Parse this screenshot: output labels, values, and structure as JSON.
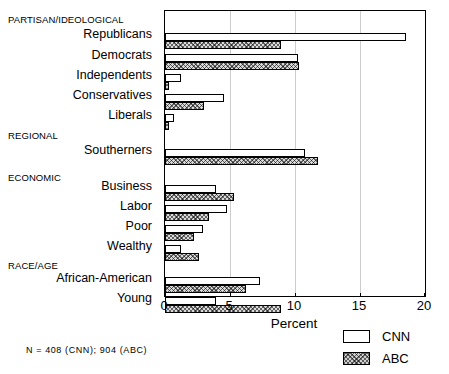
{
  "chart_data": {
    "type": "bar",
    "orientation": "horizontal",
    "title": "",
    "xlabel": "Percent",
    "ylabel": "",
    "xlim": [
      0,
      20
    ],
    "xticks": [
      0,
      5,
      10,
      15,
      20
    ],
    "xticklabels": [
      "0",
      "5",
      "10",
      "15",
      "20"
    ],
    "grid": true,
    "grid_axis": "x",
    "legend_position": "bottom-right",
    "legend": [
      "CNN",
      "ABC"
    ],
    "series": [
      {
        "name": "CNN",
        "style": "open",
        "values": [
          18.5,
          10.2,
          1.2,
          4.5,
          0.7,
          10.8,
          3.9,
          4.8,
          2.9,
          1.2,
          7.3,
          3.9
        ]
      },
      {
        "name": "ABC",
        "style": "hatched",
        "values": [
          8.9,
          10.3,
          0.3,
          3.0,
          0.3,
          11.8,
          5.3,
          3.4,
          2.2,
          2.6,
          6.2,
          8.9
        ]
      }
    ],
    "categories": [
      "Republicans",
      "Democrats",
      "Independents",
      "Conservatives",
      "Liberals",
      "Southerners",
      "Business",
      "Labor",
      "Poor",
      "Wealthy",
      "African-American",
      "Young"
    ],
    "groups": [
      {
        "header": "PARTISAN/IDEOLOGICAL",
        "categories": [
          "Republicans",
          "Democrats",
          "Independents",
          "Conservatives",
          "Liberals"
        ]
      },
      {
        "header": "REGIONAL",
        "categories": [
          "Southerners"
        ]
      },
      {
        "header": "ECONOMIC",
        "categories": [
          "Business",
          "Labor",
          "Poor",
          "Wealthy"
        ]
      },
      {
        "header": "RACE/AGE",
        "categories": [
          "African-American",
          "Young"
        ]
      }
    ],
    "annotations": [
      "N = 408 (CNN); 904 (ABC)"
    ]
  },
  "axis": {
    "xlabel": "Percent",
    "tick_0": "0",
    "tick_1": "5",
    "tick_2": "10",
    "tick_3": "15",
    "tick_4": "20"
  },
  "group_headers": {
    "partisan": "PARTISAN/IDEOLOGICAL",
    "regional": "REGIONAL",
    "economic": "ECONOMIC",
    "raceage": "RACE/AGE"
  },
  "cat_labels": {
    "republicans": "Republicans",
    "democrats": "Democrats",
    "independents": "Independents",
    "conservatives": "Conservatives",
    "liberals": "Liberals",
    "southerners": "Southerners",
    "business": "Business",
    "labor": "Labor",
    "poor": "Poor",
    "wealthy": "Wealthy",
    "african_american": "African-American",
    "young": "Young"
  },
  "legend": {
    "cnn": "CNN",
    "abc": "ABC"
  },
  "footnote": {
    "text": "N = 408 (CNN); 904 (ABC)"
  },
  "colors": {
    "axis": "#000000",
    "grid": "#cccccc",
    "cnn_fill": "#ffffff",
    "abc_fill": "#d9d9d9"
  }
}
